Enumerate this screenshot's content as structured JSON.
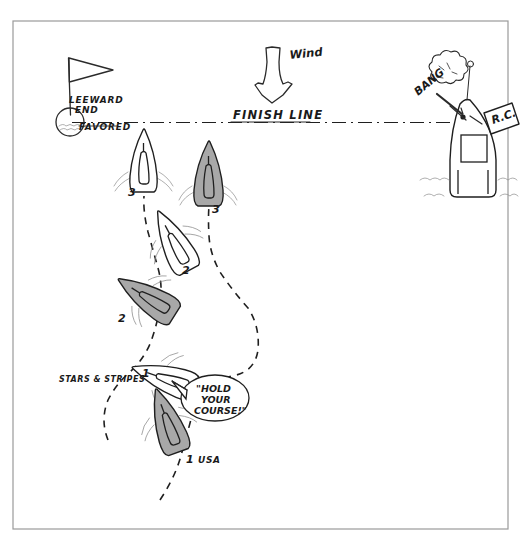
{
  "diagram": {
    "frame_color": "#9a9a9a",
    "background_color": "#ffffff"
  },
  "wind": {
    "label": "Wind",
    "direction": "down",
    "arrow_name": "wind-arrow"
  },
  "finish_line": {
    "label": "FINISH LINE",
    "style": "dash-dot"
  },
  "leeward_mark": {
    "label_line1": "LEEWARD",
    "label_line2": "END",
    "label_line3": "FAVORED",
    "flag_name": "leeward-mark-flag",
    "buoy_name": "leeward-mark-buoy"
  },
  "committee_boat": {
    "gun_sound": "BANG",
    "flag_label": "R.C.",
    "name": "race-committee-boat"
  },
  "boats": [
    {
      "id": "boat-3-white",
      "number": "3",
      "fill": "white",
      "heading": "upwind",
      "position": "left of finish line, crossing"
    },
    {
      "id": "boat-3-gray",
      "number": "3",
      "fill": "gray",
      "heading": "upwind",
      "position": "right of boat-3-white, crossing"
    },
    {
      "id": "boat-2-white",
      "number": "2",
      "fill": "white",
      "heading": "port tack angled",
      "position": "mid-course upper"
    },
    {
      "id": "boat-2-gray",
      "number": "2",
      "fill": "gray",
      "heading": "port tack angled",
      "position": "mid-course lower left"
    },
    {
      "id": "boat-1-white",
      "number": "1",
      "fill": "white",
      "heading": "reaching",
      "position": "lower course",
      "boat_name": "STARS & STRIPES"
    },
    {
      "id": "boat-1-gray",
      "number": "1",
      "fill": "gray",
      "heading": "reaching",
      "position": "lower course below white",
      "sail_number": "USA"
    }
  ],
  "labels": {
    "stars_stripes": "STARS & STRIPES",
    "usa": "USA",
    "boat_number_1": "1",
    "boat_number_2": "2",
    "boat_number_3": "3"
  },
  "speech_bubble": {
    "line1": "\"HOLD",
    "line2": "YOUR",
    "line3": "COURSE!\"",
    "speaker": "boat-1-white"
  },
  "colors": {
    "ink": "#1f1f1f",
    "gray_hull": "#a8a8a8",
    "wake": "#8d8d8d",
    "frame": "#9a9a9a"
  }
}
